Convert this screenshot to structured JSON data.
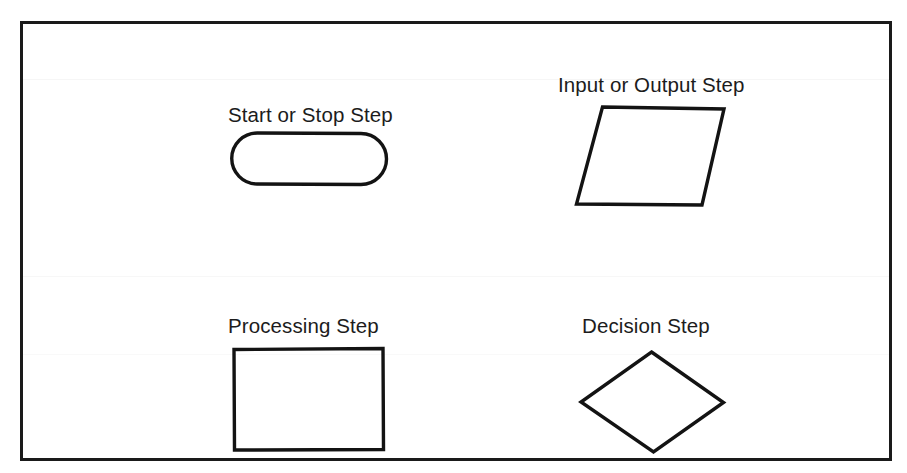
{
  "figure": {
    "background_color": "#ffffff",
    "border_color": "#1a1a1a",
    "stroke_color": "#131313",
    "text_color": "#1c1c1c"
  },
  "symbols": [
    {
      "id": "start-stop",
      "label": "Start or Stop Step",
      "shape": "stadium",
      "shape_icon": "rounded-pill-shape"
    },
    {
      "id": "input-output",
      "label": "Input or Output Step",
      "shape": "parallelogram",
      "shape_icon": "parallelogram-shape"
    },
    {
      "id": "processing",
      "label": "Processing Step",
      "shape": "rectangle",
      "shape_icon": "rectangle-shape"
    },
    {
      "id": "decision",
      "label": "Decision Step",
      "shape": "diamond",
      "shape_icon": "diamond-shape"
    }
  ]
}
